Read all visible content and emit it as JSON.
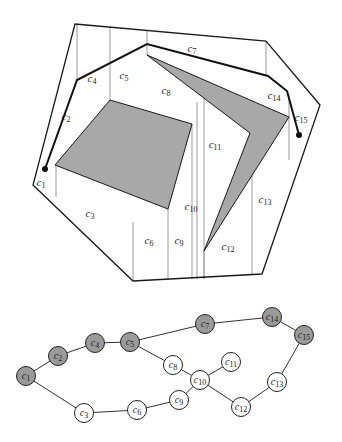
{
  "colors": {
    "obstacle_fill": "#a8a8a8",
    "outline": "#1a1a1a",
    "cell_divider": "#9a9a9a",
    "node_free_fill": "#ffffff",
    "node_path_fill": "#9a9a9a",
    "edge": "#333333"
  },
  "cell_labels": [
    {
      "id": "c1",
      "base": "c",
      "sub": "1",
      "x": 37,
      "y": 186
    },
    {
      "id": "c2",
      "base": "c",
      "sub": "2",
      "x": 62,
      "y": 120
    },
    {
      "id": "c3",
      "base": "c",
      "sub": "3",
      "x": 86,
      "y": 217
    },
    {
      "id": "c4",
      "base": "c",
      "sub": "4",
      "x": 88,
      "y": 82
    },
    {
      "id": "c5",
      "base": "c",
      "sub": "5",
      "x": 120,
      "y": 79
    },
    {
      "id": "c6",
      "base": "c",
      "sub": "6",
      "x": 145,
      "y": 244
    },
    {
      "id": "c7",
      "base": "c",
      "sub": "7",
      "x": 188,
      "y": 52
    },
    {
      "id": "c8",
      "base": "c",
      "sub": "8",
      "x": 162,
      "y": 94
    },
    {
      "id": "c9",
      "base": "c",
      "sub": "9",
      "x": 175,
      "y": 244
    },
    {
      "id": "c10",
      "base": "c",
      "sub": "10",
      "x": 187,
      "y": 210
    },
    {
      "id": "c11",
      "base": "c",
      "sub": "11",
      "x": 211,
      "y": 148
    },
    {
      "id": "c12",
      "base": "c",
      "sub": "12",
      "x": 224,
      "y": 250
    },
    {
      "id": "c13",
      "base": "c",
      "sub": "13",
      "x": 261,
      "y": 203
    },
    {
      "id": "c14",
      "base": "c",
      "sub": "14",
      "x": 270,
      "y": 99
    },
    {
      "id": "c15",
      "base": "c",
      "sub": "15",
      "x": 297,
      "y": 121
    }
  ],
  "graph": {
    "nodes": [
      {
        "id": "c1",
        "label_base": "c",
        "label_sub": "1",
        "x": 26,
        "y": 376,
        "on_path": true
      },
      {
        "id": "c2",
        "label_base": "c",
        "label_sub": "2",
        "x": 58,
        "y": 356,
        "on_path": true
      },
      {
        "id": "c3",
        "label_base": "c",
        "label_sub": "3",
        "x": 84,
        "y": 413,
        "on_path": false
      },
      {
        "id": "c4",
        "label_base": "c",
        "label_sub": "4",
        "x": 95,
        "y": 343,
        "on_path": true
      },
      {
        "id": "c5",
        "label_base": "c",
        "label_sub": "5",
        "x": 130,
        "y": 342,
        "on_path": true
      },
      {
        "id": "c6",
        "label_base": "c",
        "label_sub": "6",
        "x": 137,
        "y": 410,
        "on_path": false
      },
      {
        "id": "c7",
        "label_base": "c",
        "label_sub": "7",
        "x": 205,
        "y": 324,
        "on_path": true
      },
      {
        "id": "c8",
        "label_base": "c",
        "label_sub": "8",
        "x": 173,
        "y": 365,
        "on_path": false
      },
      {
        "id": "c9",
        "label_base": "c",
        "label_sub": "9",
        "x": 179,
        "y": 400,
        "on_path": false
      },
      {
        "id": "c10",
        "label_base": "c",
        "label_sub": "10",
        "x": 200,
        "y": 380,
        "on_path": false
      },
      {
        "id": "c11",
        "label_base": "c",
        "label_sub": "11",
        "x": 231,
        "y": 362,
        "on_path": false
      },
      {
        "id": "c12",
        "label_base": "c",
        "label_sub": "12",
        "x": 241,
        "y": 407,
        "on_path": false
      },
      {
        "id": "c13",
        "label_base": "c",
        "label_sub": "13",
        "x": 277,
        "y": 382,
        "on_path": false
      },
      {
        "id": "c14",
        "label_base": "c",
        "label_sub": "14",
        "x": 272,
        "y": 317,
        "on_path": true
      },
      {
        "id": "c15",
        "label_base": "c",
        "label_sub": "15",
        "x": 304,
        "y": 335,
        "on_path": true
      }
    ],
    "edges": [
      [
        "c1",
        "c2"
      ],
      [
        "c2",
        "c4"
      ],
      [
        "c4",
        "c5"
      ],
      [
        "c5",
        "c7"
      ],
      [
        "c7",
        "c14"
      ],
      [
        "c14",
        "c15"
      ],
      [
        "c1",
        "c3"
      ],
      [
        "c3",
        "c6"
      ],
      [
        "c6",
        "c9"
      ],
      [
        "c9",
        "c10"
      ],
      [
        "c5",
        "c8"
      ],
      [
        "c8",
        "c10"
      ],
      [
        "c10",
        "c11"
      ],
      [
        "c10",
        "c12"
      ],
      [
        "c12",
        "c13"
      ],
      [
        "c13",
        "c15"
      ]
    ]
  }
}
